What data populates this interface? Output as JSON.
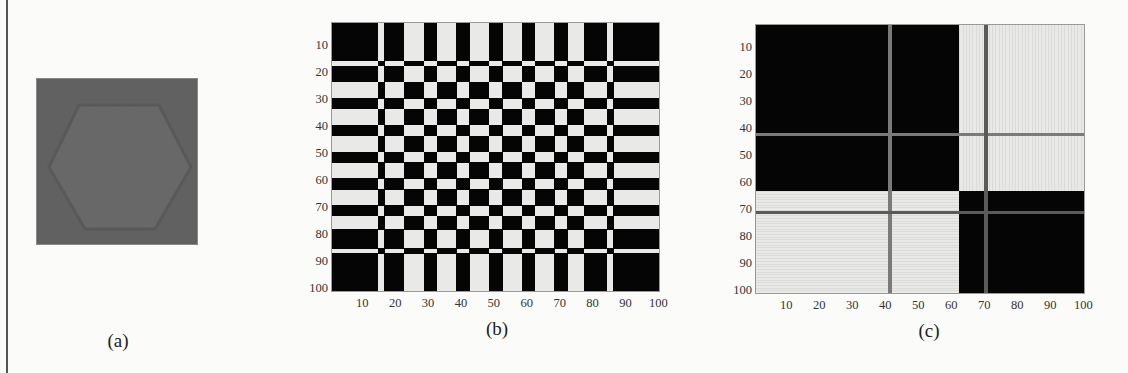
{
  "figure": {
    "panels": [
      {
        "id": "a",
        "caption": "(a)",
        "description": "synthetic image: lighter hexagon on darker gray square"
      },
      {
        "id": "b",
        "caption": "(b)"
      },
      {
        "id": "c",
        "caption": "(c)"
      }
    ],
    "colors": {
      "dark": "#050505",
      "light": "#e9e9e7",
      "panel_a_bg": "#565656",
      "panel_a_hex": "#5e5e5e",
      "grey_line_dark_block": "#7a7a7a",
      "grey_line_light_block": "#5a5a5a"
    }
  },
  "chart_data": [
    {
      "type": "image",
      "panel": "a",
      "title": "(a)",
      "content": "gray square containing a slightly lighter hexagon (flat top/bottom, pointed left/right)"
    },
    {
      "type": "heatmap",
      "panel": "b",
      "title": "(b)",
      "xlabel": "",
      "ylabel": "",
      "xlim": [
        0,
        100
      ],
      "ylim": [
        0,
        100
      ],
      "x_ticks": [
        "10",
        "20",
        "30",
        "40",
        "50",
        "60",
        "70",
        "80",
        "90",
        "100"
      ],
      "y_ticks": [
        "10",
        "20",
        "30",
        "40",
        "50",
        "60",
        "70",
        "80",
        "90",
        "100"
      ],
      "colormap": "binary (black = 1, white = 0)",
      "rule": "cell is dark when row stripe and column stripe are both dark or both light",
      "column_stripes": [
        {
          "from": 0,
          "to": 14,
          "dark": true
        },
        {
          "from": 14,
          "to": 16,
          "dark": false
        },
        {
          "from": 16,
          "to": 22,
          "dark": true
        },
        {
          "from": 22,
          "to": 28,
          "dark": false
        },
        {
          "from": 28,
          "to": 32,
          "dark": true
        },
        {
          "from": 32,
          "to": 38,
          "dark": false
        },
        {
          "from": 38,
          "to": 42,
          "dark": true
        },
        {
          "from": 42,
          "to": 48,
          "dark": false
        },
        {
          "from": 48,
          "to": 52,
          "dark": true
        },
        {
          "from": 52,
          "to": 58,
          "dark": false
        },
        {
          "from": 58,
          "to": 62,
          "dark": true
        },
        {
          "from": 62,
          "to": 68,
          "dark": false
        },
        {
          "from": 68,
          "to": 72,
          "dark": true
        },
        {
          "from": 72,
          "to": 77,
          "dark": false
        },
        {
          "from": 77,
          "to": 84,
          "dark": true
        },
        {
          "from": 84,
          "to": 86,
          "dark": false
        },
        {
          "from": 86,
          "to": 100,
          "dark": true
        }
      ],
      "row_stripes": [
        {
          "from": 0,
          "to": 14,
          "dark": true
        },
        {
          "from": 14,
          "to": 16,
          "dark": false
        },
        {
          "from": 16,
          "to": 22,
          "dark": true
        },
        {
          "from": 22,
          "to": 28,
          "dark": false
        },
        {
          "from": 28,
          "to": 32,
          "dark": true
        },
        {
          "from": 32,
          "to": 38,
          "dark": false
        },
        {
          "from": 38,
          "to": 42,
          "dark": true
        },
        {
          "from": 42,
          "to": 48,
          "dark": false
        },
        {
          "from": 48,
          "to": 52,
          "dark": true
        },
        {
          "from": 52,
          "to": 58,
          "dark": false
        },
        {
          "from": 58,
          "to": 62,
          "dark": true
        },
        {
          "from": 62,
          "to": 68,
          "dark": false
        },
        {
          "from": 68,
          "to": 72,
          "dark": true
        },
        {
          "from": 72,
          "to": 77,
          "dark": false
        },
        {
          "from": 77,
          "to": 84,
          "dark": true
        },
        {
          "from": 84,
          "to": 86,
          "dark": false
        },
        {
          "from": 86,
          "to": 100,
          "dark": true
        }
      ]
    },
    {
      "type": "heatmap",
      "panel": "c",
      "title": "(c)",
      "xlabel": "",
      "ylabel": "",
      "xlim": [
        0,
        100
      ],
      "ylim": [
        0,
        100
      ],
      "x_ticks": [
        "10",
        "20",
        "30",
        "40",
        "50",
        "60",
        "70",
        "80",
        "90",
        "100"
      ],
      "y_ticks": [
        "10",
        "20",
        "30",
        "40",
        "50",
        "60",
        "70",
        "80",
        "90",
        "100"
      ],
      "colormap": "binary (black = 1, white = 0)",
      "blocks": [
        {
          "rows": [
            0,
            62
          ],
          "cols": [
            0,
            62
          ],
          "dark": true
        },
        {
          "rows": [
            0,
            62
          ],
          "cols": [
            62,
            100
          ],
          "dark": false
        },
        {
          "rows": [
            62,
            100
          ],
          "cols": [
            0,
            62
          ],
          "dark": false
        },
        {
          "rows": [
            62,
            100
          ],
          "cols": [
            62,
            100
          ],
          "dark": true
        }
      ],
      "outlier_lines": [
        {
          "orientation": "vertical",
          "at": 41
        },
        {
          "orientation": "horizontal",
          "at": 41
        },
        {
          "orientation": "vertical",
          "at": 70
        },
        {
          "orientation": "horizontal",
          "at": 70
        }
      ]
    }
  ]
}
